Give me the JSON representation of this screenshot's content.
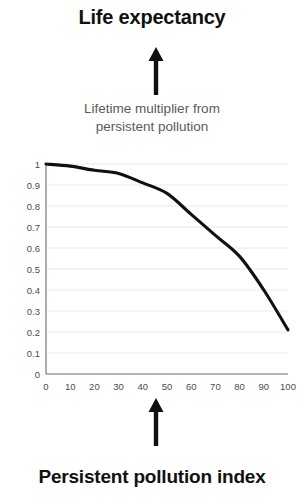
{
  "figure": {
    "top_title": "Life expectancy",
    "bottom_title": "Persistent pollution index",
    "caption_line1": "Lifetime multiplier from",
    "caption_line2": "persistent pollution",
    "arrow_up_top_name": "arrow-up",
    "arrow_up_bottom_name": "arrow-up",
    "colors": {
      "title": "#111111",
      "caption": "#5a5a5a",
      "curve": "#101010",
      "grid": "#e9e9e9",
      "axis": "#9a9a9a",
      "tick_label": "#4d4d4d",
      "background": "#ffffff"
    }
  },
  "chart_data": {
    "type": "line",
    "title": "",
    "xlabel": "Persistent pollution index",
    "ylabel": "Lifetime multiplier from persistent pollution",
    "xlim": [
      0,
      100
    ],
    "ylim": [
      0,
      1
    ],
    "grid": true,
    "legend": "none",
    "x_ticks": [
      "0",
      "10",
      "20",
      "30",
      "40",
      "50",
      "60",
      "70",
      "80",
      "90",
      "100"
    ],
    "y_ticks": [
      "0",
      "0.1",
      "0.2",
      "0.3",
      "0.4",
      "0.5",
      "0.6",
      "0.7",
      "0.8",
      "0.9",
      "1"
    ],
    "x": [
      0,
      10,
      20,
      30,
      40,
      50,
      60,
      70,
      80,
      90,
      100
    ],
    "values": [
      1.0,
      0.99,
      0.97,
      0.955,
      0.91,
      0.86,
      0.76,
      0.66,
      0.56,
      0.4,
      0.21
    ],
    "series": [
      {
        "name": "Lifetime multiplier from persistent pollution",
        "values": [
          1.0,
          0.99,
          0.97,
          0.955,
          0.91,
          0.86,
          0.76,
          0.66,
          0.56,
          0.4,
          0.21
        ]
      }
    ]
  }
}
